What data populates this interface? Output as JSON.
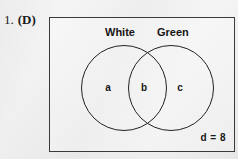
{
  "question": {
    "number": "1.",
    "answer_choice": "(D)"
  },
  "diagram": {
    "type": "venn-two-set",
    "sets": [
      {
        "name": "White",
        "label": "White"
      },
      {
        "name": "Green",
        "label": "Green"
      }
    ],
    "regions": [
      {
        "id": "a",
        "label": "a",
        "meaning": "white-only"
      },
      {
        "id": "b",
        "label": "b",
        "meaning": "white-and-green-intersection"
      },
      {
        "id": "c",
        "label": "c",
        "meaning": "green-only"
      }
    ],
    "universal_region": {
      "label": "d = 8",
      "variable": "d",
      "value": "8"
    }
  },
  "colors": {
    "paper": "#f2f2f2",
    "ink": "#161616",
    "frame": "#3a3a3a",
    "circle_stroke": "#222222"
  }
}
